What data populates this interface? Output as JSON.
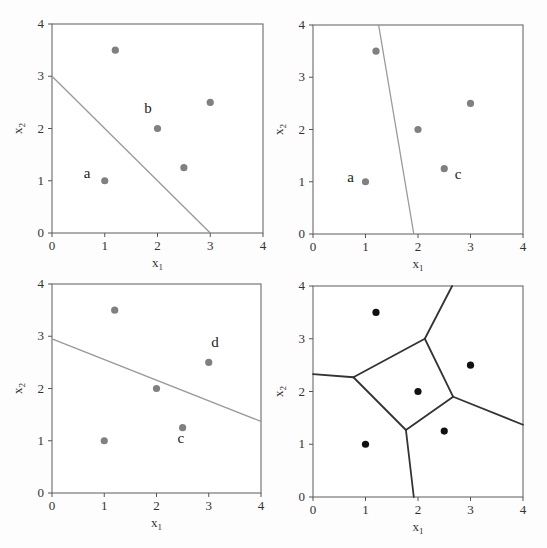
{
  "chart_data": [
    {
      "type": "scatter",
      "panel": "top-left",
      "xlabel": "x1",
      "ylabel": "x2",
      "xlim": [
        0,
        4
      ],
      "ylim": [
        0,
        4
      ],
      "xticks": [
        "0",
        "1",
        "2",
        "3",
        "4"
      ],
      "yticks": [
        "0",
        "1",
        "2",
        "3",
        "4"
      ],
      "points": [
        [
          1,
          1
        ],
        [
          1.2,
          3.5
        ],
        [
          2,
          2
        ],
        [
          2.5,
          1.25
        ],
        [
          3,
          2.5
        ]
      ],
      "point_color": "#808080",
      "line": [
        [
          0,
          3
        ],
        [
          3,
          0
        ]
      ],
      "line_color": "#999999",
      "annotations": [
        {
          "text": "a",
          "x": 0.6,
          "y": 1.05
        },
        {
          "text": "b",
          "x": 1.75,
          "y": 2.3
        }
      ]
    },
    {
      "type": "scatter",
      "panel": "top-right",
      "xlabel": "x1",
      "ylabel": "x2",
      "xlim": [
        0,
        4
      ],
      "ylim": [
        0,
        4
      ],
      "xticks": [
        "0",
        "1",
        "2",
        "3",
        "4"
      ],
      "yticks": [
        "0",
        "1",
        "2",
        "3",
        "4"
      ],
      "points": [
        [
          1,
          1
        ],
        [
          1.2,
          3.5
        ],
        [
          2,
          2
        ],
        [
          2.5,
          1.25
        ],
        [
          3,
          2.5
        ]
      ],
      "point_color": "#808080",
      "line": [
        [
          1.25,
          4
        ],
        [
          1.92,
          0
        ]
      ],
      "line_color": "#999999",
      "annotations": [
        {
          "text": "a",
          "x": 0.65,
          "y": 1.0
        },
        {
          "text": "c",
          "x": 2.7,
          "y": 1.05
        }
      ]
    },
    {
      "type": "scatter",
      "panel": "bottom-left",
      "xlabel": "x1",
      "ylabel": "x2",
      "xlim": [
        0,
        4
      ],
      "ylim": [
        0,
        4
      ],
      "xticks": [
        "0",
        "1",
        "2",
        "3",
        "4"
      ],
      "yticks": [
        "0",
        "1",
        "2",
        "3",
        "4"
      ],
      "points": [
        [
          1,
          1
        ],
        [
          1.2,
          3.5
        ],
        [
          2,
          2
        ],
        [
          2.5,
          1.25
        ],
        [
          3,
          2.5
        ]
      ],
      "point_color": "#808080",
      "line": [
        [
          0,
          2.95
        ],
        [
          4,
          1.37
        ]
      ],
      "line_color": "#999999",
      "annotations": [
        {
          "text": "d",
          "x": 3.05,
          "y": 2.8
        },
        {
          "text": "c",
          "x": 2.4,
          "y": 0.95
        }
      ]
    },
    {
      "type": "scatter",
      "panel": "bottom-right",
      "xlabel": "x1",
      "ylabel": "x2",
      "xlim": [
        0,
        4
      ],
      "ylim": [
        0,
        4
      ],
      "xticks": [
        "0",
        "1",
        "2",
        "3",
        "4"
      ],
      "yticks": [
        "0",
        "1",
        "2",
        "3",
        "4"
      ],
      "points": [
        [
          1,
          1
        ],
        [
          1.2,
          3.5
        ],
        [
          2,
          2
        ],
        [
          2.5,
          1.25
        ],
        [
          3,
          2.5
        ]
      ],
      "point_color": "#111111",
      "voronoi_edges": [
        [
          [
            0,
            2.33
          ],
          [
            0.77,
            2.27
          ]
        ],
        [
          [
            0.77,
            2.27
          ],
          [
            2.13,
            3.0
          ]
        ],
        [
          [
            2.13,
            3.0
          ],
          [
            2.65,
            4.0
          ]
        ],
        [
          [
            2.13,
            3.0
          ],
          [
            2.67,
            1.9
          ]
        ],
        [
          [
            2.67,
            1.9
          ],
          [
            4,
            1.37
          ]
        ],
        [
          [
            2.67,
            1.9
          ],
          [
            1.77,
            1.27
          ]
        ],
        [
          [
            1.77,
            1.27
          ],
          [
            0.77,
            2.27
          ]
        ],
        [
          [
            1.77,
            1.27
          ],
          [
            1.92,
            0
          ]
        ]
      ],
      "line_color": "#333333"
    }
  ],
  "labels": {
    "x_axis": "x",
    "x_sub": "1",
    "y_axis": "x",
    "y_sub": "2"
  }
}
